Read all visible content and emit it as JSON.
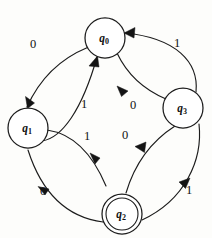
{
  "diagram": {
    "type": "state-transition-diagram",
    "title": "",
    "alphabet": [
      "0",
      "1"
    ],
    "start_state": "",
    "accepting_states": [
      "q2"
    ],
    "states": [
      {
        "id": "q0",
        "label": "q",
        "subscript": "0",
        "x": 105,
        "y": 38,
        "radius": 20,
        "accepting": false
      },
      {
        "id": "q1",
        "label": "q",
        "subscript": "1",
        "x": 28,
        "y": 128,
        "radius": 20,
        "accepting": false
      },
      {
        "id": "q2",
        "label": "q",
        "subscript": "2",
        "x": 122,
        "y": 214,
        "radius": 20,
        "accepting": true,
        "inner_radius": 16
      },
      {
        "id": "q3",
        "label": "q",
        "subscript": "3",
        "x": 183,
        "y": 108,
        "radius": 20,
        "accepting": false
      }
    ],
    "transitions": [
      {
        "id": "t-q0-q1",
        "from": "q0",
        "to": "q1",
        "symbol": "0",
        "label_x": 33,
        "label_y": 44,
        "style": "outer-arc"
      },
      {
        "id": "t-q1-q0",
        "from": "q1",
        "to": "q0",
        "symbol": "1",
        "label_x": 84,
        "label_y": 104,
        "style": "inner-arc"
      },
      {
        "id": "t-q0-q3",
        "from": "q0",
        "to": "q3",
        "symbol": "0",
        "label_x": 133,
        "label_y": 105,
        "style": "inner-arc"
      },
      {
        "id": "t-q3-q0",
        "from": "q3",
        "to": "q0",
        "symbol": "1",
        "label_x": 177,
        "label_y": 43,
        "style": "outer-arc"
      },
      {
        "id": "t-q1-q2",
        "from": "q1",
        "to": "q2",
        "symbol": "1",
        "label_x": 87,
        "label_y": 136,
        "style": "inner-arc"
      },
      {
        "id": "t-q2-q1",
        "from": "q2",
        "to": "q1",
        "symbol": "0",
        "label_x": 43,
        "label_y": 191,
        "style": "outer-arc"
      },
      {
        "id": "t-q2-q3",
        "from": "q2",
        "to": "q3",
        "symbol": "0",
        "label_x": 125,
        "label_y": 135,
        "style": "inner-arc"
      },
      {
        "id": "t-q3-q2",
        "from": "q3",
        "to": "q2",
        "symbol": "1",
        "label_x": 189,
        "label_y": 190,
        "style": "outer-arc"
      }
    ],
    "colors": {
      "stroke": "#1c1c1c",
      "text": "#111111",
      "background": "#fdfdfb"
    }
  }
}
